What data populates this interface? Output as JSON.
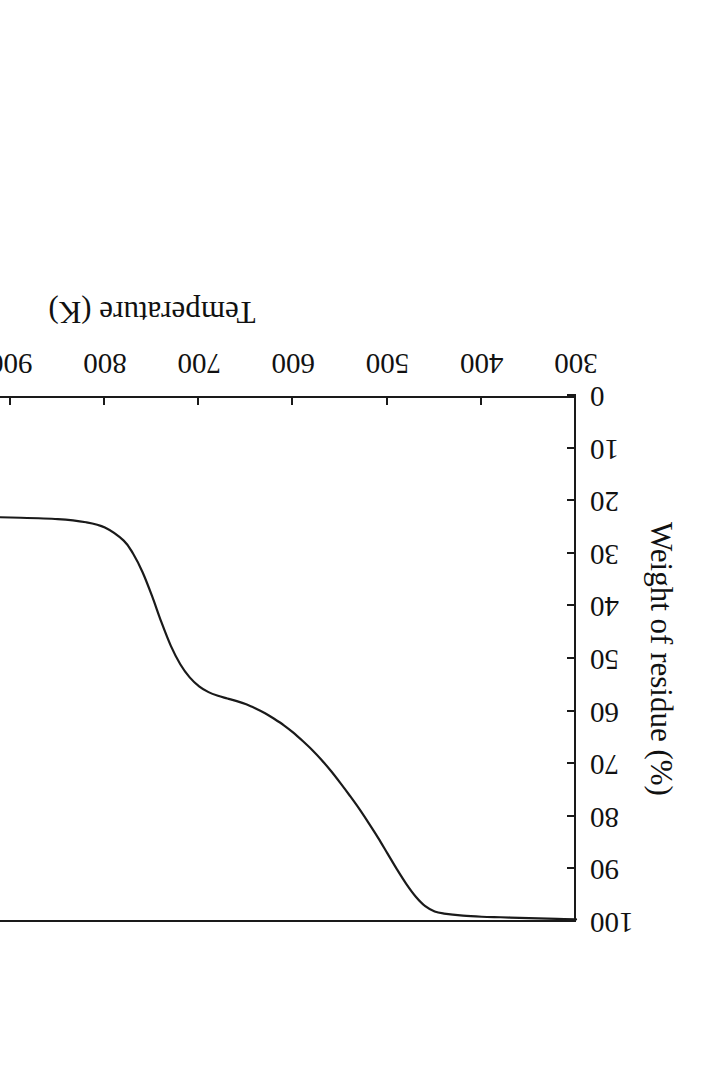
{
  "figure": {
    "rotation_degrees": 180,
    "background_color": "#ffffff",
    "line_color": "#1a1a1a",
    "axis_color": "#1a1a1a"
  },
  "chart_data": {
    "type": "line",
    "title": "",
    "xlabel": "Temperature (K)",
    "ylabel": "Weight of residue (%)",
    "xlim": [
      300,
      1200
    ],
    "ylim": [
      0,
      100
    ],
    "xticks": [
      300,
      400,
      500,
      600,
      700,
      800,
      900,
      1000,
      1100,
      1200
    ],
    "xticklabels": [
      "300",
      "400",
      "500",
      "600",
      "700",
      "800",
      "900",
      "1000",
      "1100",
      "1200"
    ],
    "yticks": [
      0,
      10,
      20,
      30,
      40,
      50,
      60,
      70,
      80,
      90,
      100
    ],
    "yticklabels": [
      "0",
      "10",
      "20",
      "30",
      "40",
      "50",
      "60",
      "70",
      "80",
      "90",
      "100"
    ],
    "grid": false,
    "legend": null,
    "series": [
      {
        "name": "Weight of residue",
        "x": [
          300,
          320,
          340,
          360,
          380,
          400,
          420,
          440,
          450,
          460,
          470,
          480,
          490,
          500,
          510,
          520,
          530,
          540,
          550,
          560,
          570,
          580,
          590,
          600,
          610,
          620,
          630,
          640,
          650,
          660,
          670,
          680,
          690,
          700,
          710,
          720,
          730,
          740,
          750,
          760,
          770,
          780,
          800,
          820,
          850,
          900,
          950,
          1000,
          1050,
          1100,
          1150,
          1180
        ],
        "y": [
          99.5,
          99.4,
          99.3,
          99.2,
          99.1,
          99.0,
          98.8,
          98.4,
          98.0,
          97.0,
          95.2,
          92.8,
          90.0,
          87.0,
          84.0,
          81.2,
          78.5,
          76.0,
          73.6,
          71.3,
          69.2,
          67.3,
          65.6,
          64.0,
          62.6,
          61.4,
          60.3,
          59.4,
          58.6,
          58.0,
          57.5,
          57.0,
          56.3,
          55.2,
          53.5,
          51.0,
          47.5,
          43.0,
          38.0,
          33.5,
          30.0,
          27.5,
          25.0,
          24.0,
          23.4,
          23.1,
          22.9,
          22.8,
          22.7,
          22.6,
          22.5,
          22.4
        ]
      }
    ],
    "annotations": []
  }
}
